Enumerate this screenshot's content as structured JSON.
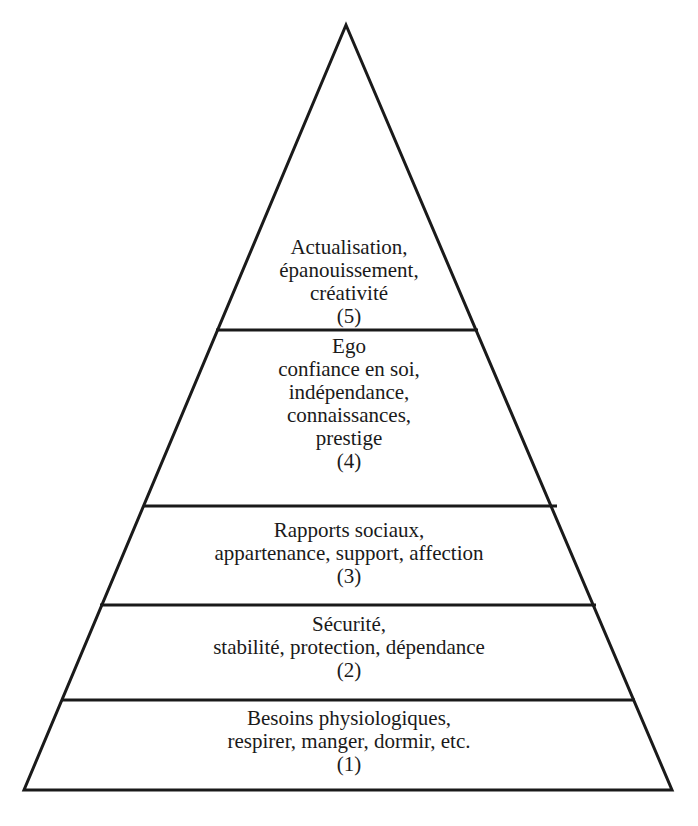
{
  "diagram": {
    "type": "pyramid",
    "title": "",
    "stroke_color": "#1a1a1a",
    "background": "#ffffff",
    "levels": [
      {
        "rank": "(5)",
        "lines": [
          "Actualisation,",
          "épanouissement,",
          "créativité"
        ]
      },
      {
        "rank": "(4)",
        "lines": [
          "Ego",
          "confiance en soi,",
          "indépendance,",
          "connaissances,",
          "prestige"
        ]
      },
      {
        "rank": "(3)",
        "lines": [
          "Rapports sociaux,",
          "appartenance, support, affection"
        ]
      },
      {
        "rank": "(2)",
        "lines": [
          "Sécurité,",
          "stabilité, protection, dépendance"
        ]
      },
      {
        "rank": "(1)",
        "lines": [
          "Besoins physiologiques,",
          "respirer, manger, dormir, etc."
        ]
      }
    ]
  }
}
